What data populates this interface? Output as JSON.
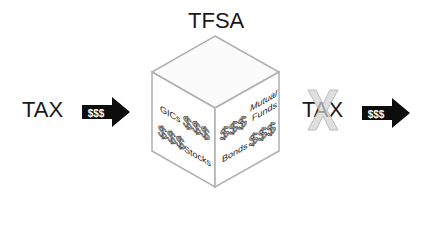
{
  "title": "TFSA",
  "left": {
    "label": "TAX",
    "arrow_text": "$$$"
  },
  "right": {
    "label": "TAX",
    "arrow_text": "$$$",
    "crossed_out": true
  },
  "cube": {
    "left_face": {
      "items": [
        "GICs",
        "$$$",
        "$$$",
        "Stocks"
      ]
    },
    "right_face": {
      "items": [
        "$$$",
        "Mutual",
        "Funds",
        "Bonds",
        "$$$"
      ]
    }
  },
  "colors": {
    "edge": "#b0b0b0",
    "text": "#1a1a1a",
    "arrow": "#0d0d0d",
    "cross": "#d0d0d0"
  }
}
